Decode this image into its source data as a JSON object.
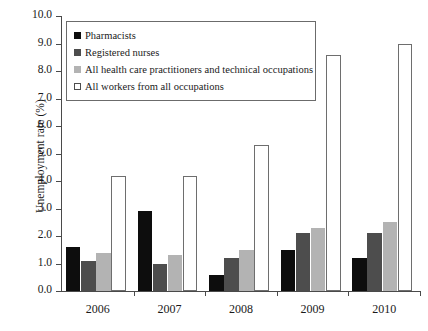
{
  "chart_data": {
    "type": "bar",
    "title": "",
    "xlabel": "",
    "ylabel": "Unemployment rate (%)",
    "ylim": [
      0.0,
      10.0
    ],
    "ytick_step": 1.0,
    "grid": false,
    "legend_position": "upper-left-inside",
    "categories": [
      "2006",
      "2007",
      "2008",
      "2009",
      "2010"
    ],
    "ytick_labels": [
      "10.0",
      "9.0",
      "8.0",
      "7.0",
      "6.0",
      "5.0",
      "4.0",
      "3.0",
      "2.0",
      "1.0",
      "0.0"
    ],
    "series": [
      {
        "name": "Pharmacists",
        "color": "#0d0d0d",
        "swatch": "sw-black",
        "fill": "fill-black",
        "values": [
          1.6,
          2.9,
          0.6,
          1.5,
          1.2
        ]
      },
      {
        "name": "Registered nurses",
        "color": "#4d4d4d",
        "swatch": "sw-dark",
        "fill": "fill-dark",
        "values": [
          1.1,
          1.0,
          1.2,
          2.1,
          2.1
        ]
      },
      {
        "name": "All health care practitioners and technical occupations",
        "color": "#b3b3b3",
        "swatch": "sw-light",
        "fill": "fill-light",
        "values": [
          1.4,
          1.3,
          1.5,
          2.3,
          2.5
        ]
      },
      {
        "name": "All workers from all occupations",
        "color": "#ffffff",
        "swatch": "sw-white",
        "fill": "fill-white",
        "values": [
          4.2,
          4.2,
          5.3,
          8.6,
          9.0
        ]
      }
    ]
  }
}
